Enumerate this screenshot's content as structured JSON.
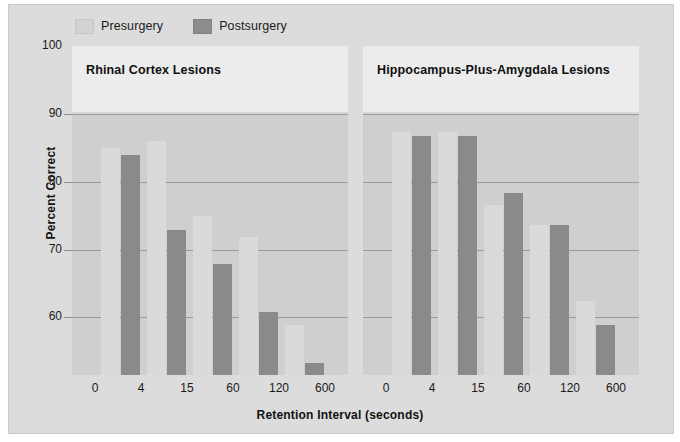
{
  "chart_data": {
    "type": "bar",
    "title": "",
    "xlabel": "Retention Interval (seconds)",
    "ylabel": "Percent Correct",
    "categories": [
      "0",
      "4",
      "15",
      "60",
      "120",
      "600"
    ],
    "ylim": [
      51.5,
      100
    ],
    "yticks": [
      60,
      70,
      80,
      90,
      100
    ],
    "grid": true,
    "legend_position": "top-left",
    "legend": [
      "Presurgery",
      "Postsurgery"
    ],
    "panels": [
      {
        "title": "Rhinal Cortex Lesions",
        "series": [
          {
            "name": "Presurgery",
            "values": [
              85.0,
              86.0,
              75.0,
              71.8,
              58.8,
              null
            ]
          },
          {
            "name": "Postsurgery",
            "values": [
              84.0,
              72.9,
              67.8,
              60.8,
              53.3,
              null
            ]
          }
        ]
      },
      {
        "title": "Hippocampus-Plus-Amygdala Lesions",
        "series": [
          {
            "name": "Presurgery",
            "values": [
              87.3,
              87.3,
              76.6,
              73.6,
              62.4,
              null
            ]
          },
          {
            "name": "Postsurgery",
            "values": [
              86.8,
              86.8,
              78.4,
              73.6,
              58.8,
              null
            ]
          }
        ]
      }
    ]
  },
  "legend": {
    "presurgery_label": "Presurgery",
    "postsurgery_label": "Postsurgery",
    "presurgery_color": "#dadada",
    "postsurgery_color": "#8a8a8a"
  },
  "axes": {
    "y_title": "Percent Correct",
    "x_title": "Retention Interval (seconds)",
    "y_ticks": [
      "100",
      "90",
      "80",
      "70",
      "60"
    ],
    "x_ticks": [
      "0",
      "4",
      "15",
      "60",
      "120",
      "600"
    ]
  },
  "panels": {
    "left_title": "Rhinal Cortex Lesions",
    "right_title": "Hippocampus-Plus-Amygdala Lesions"
  }
}
